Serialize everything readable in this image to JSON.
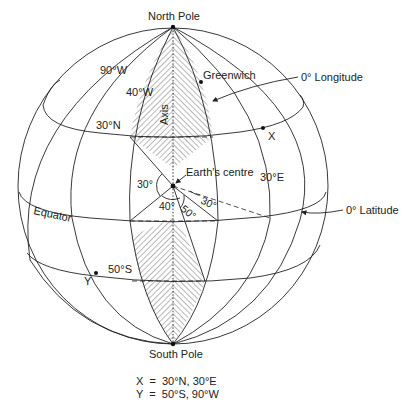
{
  "diagram": {
    "labels": {
      "north_pole": "North Pole",
      "south_pole": "South Pole",
      "greenwich": "Greenwich",
      "zero_longitude": "0° Longitude",
      "zero_latitude": "0° Latitude",
      "equator": "Equator",
      "axis": "Axis",
      "earths_centre": "Earth's centre",
      "lon_90w": "90°W",
      "lon_40w": "40°W",
      "lon_30e": "30°E",
      "lat_30n": "30°N",
      "lat_50s": "50°S",
      "point_x": "X",
      "point_y": "Y"
    },
    "angles": {
      "angle_30_left": "30°",
      "angle_40": "40°",
      "angle_50": "50°",
      "angle_30_right": "30°"
    },
    "legend": [
      {
        "point": "X",
        "text": "X  =  30°N, 30°E"
      },
      {
        "point": "Y",
        "text": "Y  =  50°S, 90°W"
      }
    ],
    "points": {
      "X": {
        "lat": "30°N",
        "lon": "30°E"
      },
      "Y": {
        "lat": "50°S",
        "lon": "90°W"
      }
    },
    "colors": {
      "line": "#222222",
      "background": "#ffffff"
    }
  }
}
